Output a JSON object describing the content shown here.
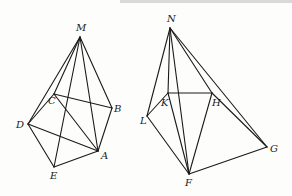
{
  "figures": [
    {
      "name": "pyramid-M",
      "apex": "M",
      "points": {
        "M": {
          "x": 80,
          "y": 37,
          "lx": 76,
          "ly": 31
        },
        "C": {
          "x": 54,
          "y": 94,
          "lx": 48,
          "ly": 104
        },
        "B": {
          "x": 112,
          "y": 108,
          "lx": 114,
          "ly": 112
        },
        "D": {
          "x": 28,
          "y": 124,
          "lx": 16,
          "ly": 128
        },
        "A": {
          "x": 98,
          "y": 151,
          "lx": 101,
          "ly": 159
        },
        "E": {
          "x": 54,
          "y": 167,
          "lx": 50,
          "ly": 179
        }
      },
      "edges": [
        [
          "M",
          "D"
        ],
        [
          "M",
          "C"
        ],
        [
          "M",
          "E"
        ],
        [
          "M",
          "A"
        ],
        [
          "M",
          "B"
        ],
        [
          "C",
          "B"
        ],
        [
          "C",
          "D"
        ],
        [
          "C",
          "A"
        ],
        [
          "D",
          "A"
        ],
        [
          "D",
          "E"
        ],
        [
          "E",
          "A"
        ],
        [
          "B",
          "A"
        ]
      ]
    },
    {
      "name": "pyramid-N",
      "apex": "N",
      "points": {
        "N": {
          "x": 170,
          "y": 28,
          "lx": 167,
          "ly": 22
        },
        "K": {
          "x": 168,
          "y": 93,
          "lx": 161,
          "ly": 106
        },
        "H": {
          "x": 212,
          "y": 93,
          "lx": 212,
          "ly": 106
        },
        "L": {
          "x": 147,
          "y": 116,
          "lx": 140,
          "ly": 124
        },
        "G": {
          "x": 267,
          "y": 147,
          "lx": 270,
          "ly": 152
        },
        "F": {
          "x": 189,
          "y": 174,
          "lx": 185,
          "ly": 186
        }
      },
      "edges": [
        [
          "N",
          "L"
        ],
        [
          "N",
          "K"
        ],
        [
          "N",
          "F"
        ],
        [
          "N",
          "H"
        ],
        [
          "N",
          "G"
        ],
        [
          "K",
          "H"
        ],
        [
          "K",
          "L"
        ],
        [
          "K",
          "F"
        ],
        [
          "L",
          "F"
        ],
        [
          "H",
          "F"
        ],
        [
          "H",
          "G"
        ],
        [
          "F",
          "G"
        ]
      ]
    }
  ]
}
